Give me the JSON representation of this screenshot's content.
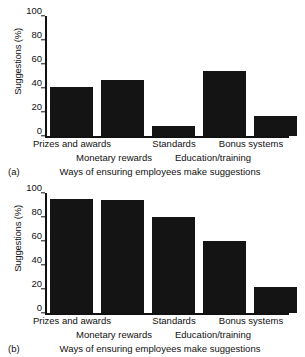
{
  "chart_data": [
    {
      "type": "bar",
      "panel": "(a)",
      "title": "",
      "xlabel": "Ways of ensuring employees make suggestions",
      "ylabel": "Suggestions (%)",
      "ylim": [
        0,
        100
      ],
      "yticks": [
        0,
        20,
        40,
        60,
        80,
        100
      ],
      "grid": false,
      "legend": "none",
      "categories": [
        "Prizes and awards",
        "",
        "Standards",
        "",
        "Bonus systems"
      ],
      "category_labels_shown": [
        "Prizes and awards",
        "Standards",
        "Bonus systems"
      ],
      "group_labels": [
        "Monetary rewards",
        "Education/training"
      ],
      "values": [
        41,
        47,
        8,
        54,
        17
      ]
    },
    {
      "type": "bar",
      "panel": "(b)",
      "title": "",
      "xlabel": "Ways of ensuring employees make suggestions",
      "ylabel": "Suggestions (%)",
      "ylim": [
        0,
        100
      ],
      "yticks": [
        0,
        20,
        40,
        60,
        80,
        100
      ],
      "grid": false,
      "legend": "none",
      "categories": [
        "Prizes and awards",
        "",
        "Standards",
        "",
        "Bonus systems"
      ],
      "category_labels_shown": [
        "Prizes and awards",
        "Standards",
        "Bonus systems"
      ],
      "group_labels": [
        "Monetary rewards",
        "Education/training"
      ],
      "values": [
        95,
        94,
        80,
        60,
        22
      ]
    }
  ],
  "figures": [
    {
      "id": "a",
      "panel_letter": "(a)",
      "ylabel": "Suggestions (%)",
      "axis_title": "Ways of ensuring employees make suggestions",
      "yticks": [
        "100",
        "80",
        "60",
        "40",
        "20",
        "0"
      ],
      "categories": [
        "Prizes and awards",
        "Standards",
        "Bonus systems"
      ],
      "groups": [
        "Monetary rewards",
        "Education/training"
      ],
      "values": [
        41,
        47,
        8,
        54,
        17
      ]
    },
    {
      "id": "b",
      "panel_letter": "(b)",
      "ylabel": "Suggestions (%)",
      "axis_title": "Ways of ensuring employees make suggestions",
      "yticks": [
        "100",
        "80",
        "60",
        "40",
        "20",
        "0"
      ],
      "categories": [
        "Prizes and awards",
        "Standards",
        "Bonus systems"
      ],
      "groups": [
        "Monetary rewards",
        "Education/training"
      ],
      "values": [
        95,
        94,
        80,
        60,
        22
      ]
    }
  ],
  "colors": {
    "bar": "#141414",
    "axis": "#111111",
    "background": "#ffffff",
    "text": "#111111"
  }
}
